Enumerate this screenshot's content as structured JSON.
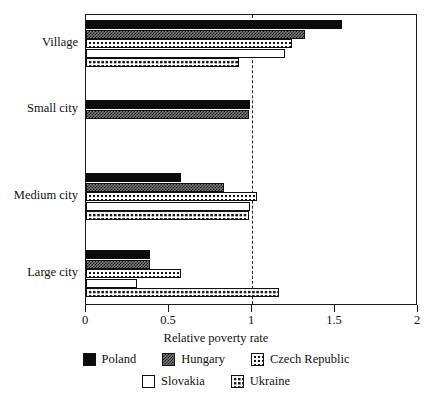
{
  "chart_data": {
    "type": "bar",
    "orientation": "horizontal",
    "title": "",
    "xlabel": "Relative poverty rate",
    "ylabel": "",
    "xlim": [
      0,
      2
    ],
    "xticks": [
      "0",
      "0.5",
      "1",
      "1.5",
      "2"
    ],
    "xtick_values": [
      0,
      0.5,
      1,
      1.5,
      2
    ],
    "grid": false,
    "reference_line": 1,
    "legend_position": "bottom",
    "categories": [
      "Village",
      "Small city",
      "Medium city",
      "Large city"
    ],
    "series": [
      {
        "name": "Poland",
        "fill": "solid-black",
        "values": [
          1.54,
          0.99,
          0.57,
          0.385
        ]
      },
      {
        "name": "Hungary",
        "fill": "checkerboard",
        "values": [
          1.32,
          0.98,
          0.83,
          0.385
        ]
      },
      {
        "name": "Czech Republic",
        "fill": "sparse-dots",
        "values": [
          1.24,
          null,
          1.03,
          0.57
        ]
      },
      {
        "name": "Slovakia",
        "fill": "fine-dots",
        "values": [
          1.2,
          null,
          0.99,
          0.31
        ]
      },
      {
        "name": "Ukraine",
        "fill": "dense-dots",
        "values": [
          0.92,
          null,
          0.98,
          1.16
        ]
      }
    ]
  },
  "axis": {
    "x_title": "Relative poverty rate"
  },
  "legend": {
    "rows": [
      [
        "Poland",
        "Hungary",
        "Czech Republic"
      ],
      [
        "Slovakia",
        "Ukraine"
      ]
    ]
  },
  "caption_fragment": ""
}
